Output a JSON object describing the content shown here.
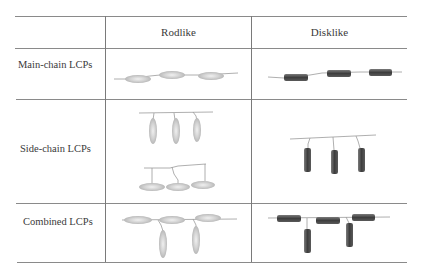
{
  "table": {
    "columns": [
      "",
      "Rodlike",
      "Disklike"
    ],
    "rows": [
      {
        "label": "Main-chain LCPs",
        "rodlike": "main-chain-rodlike-diagram",
        "disklike": "main-chain-disklike-diagram"
      },
      {
        "label": "Side-chain LCPs",
        "rodlike": "side-chain-rodlike-diagram",
        "disklike": "side-chain-disklike-diagram"
      },
      {
        "label": "Combined LCPs",
        "rodlike": "combined-rodlike-diagram",
        "disklike": "combined-disklike-diagram"
      }
    ]
  },
  "colors": {
    "rule": "#8a8a8a",
    "rod_fill": "#c8c8c8",
    "rod_center": "#ececec",
    "disk_fill": "#4a4a4a",
    "disk_edge": "#2e2e2e",
    "chain": "#9a9a9a"
  }
}
